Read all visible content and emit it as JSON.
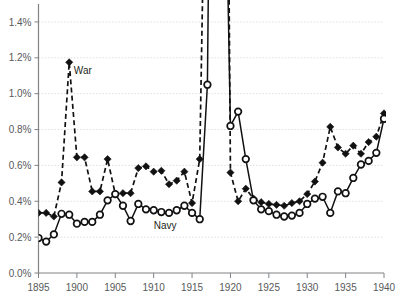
{
  "chart_data": {
    "type": "line",
    "title": "",
    "subtitle": "",
    "xlabel": "",
    "ylabel": "",
    "xlim": [
      1895,
      1940
    ],
    "ylim": [
      0.0,
      1.5
    ],
    "grid": true,
    "legend_position": "inline-annotation",
    "x_tick_labels": [
      "1895",
      "1900",
      "1905",
      "1910",
      "1915",
      "1920",
      "1925",
      "1930",
      "1935",
      "1940"
    ],
    "x_ticks": [
      1895,
      1900,
      1905,
      1910,
      1915,
      1920,
      1925,
      1930,
      1935,
      1940
    ],
    "y_tick_labels": [
      "0.0%",
      "0.2%",
      "0.4%",
      "0.6%",
      "0.8%",
      "1.0%",
      "1.2%",
      "1.4%"
    ],
    "y_ticks": [
      0.0,
      0.2,
      0.4,
      0.6,
      0.8,
      1.0,
      1.2,
      1.4
    ],
    "y_unit": "%",
    "clip_note": "War and Navy series exceed the 1.5% axis top during 1917-1919 and in 1940; those segments run off the top of the plot.",
    "annotations": [
      {
        "text": "War",
        "x": 1899.6,
        "y": 1.11
      },
      {
        "text": "Navy",
        "x": 1910.0,
        "y": 0.245
      }
    ],
    "x": [
      1895,
      1896,
      1897,
      1898,
      1899,
      1900,
      1901,
      1902,
      1903,
      1904,
      1905,
      1906,
      1907,
      1908,
      1909,
      1910,
      1911,
      1912,
      1913,
      1914,
      1915,
      1916,
      1917,
      1918,
      1919,
      1920,
      1921,
      1922,
      1923,
      1924,
      1925,
      1926,
      1927,
      1928,
      1929,
      1930,
      1931,
      1932,
      1933,
      1934,
      1935,
      1936,
      1937,
      1938,
      1939,
      1940
    ],
    "series": [
      {
        "name": "War",
        "marker": "filled-diamond",
        "line_style": "dashed",
        "values": [
          0.335,
          0.335,
          0.315,
          0.505,
          1.175,
          0.645,
          0.645,
          0.455,
          0.455,
          0.635,
          0.44,
          0.445,
          0.445,
          0.585,
          0.595,
          0.565,
          0.57,
          0.495,
          0.515,
          0.565,
          0.39,
          0.635,
          3.1,
          14.5,
          6.2,
          0.56,
          0.4,
          0.47,
          0.415,
          0.395,
          0.385,
          0.38,
          0.375,
          0.39,
          0.4,
          0.44,
          0.51,
          0.615,
          0.815,
          0.7,
          0.665,
          0.71,
          0.665,
          0.73,
          0.76,
          0.89
        ]
      },
      {
        "name": "Navy",
        "marker": "open-circle",
        "line_style": "solid",
        "values": [
          0.195,
          0.175,
          0.215,
          0.33,
          0.325,
          0.275,
          0.285,
          0.285,
          0.325,
          0.405,
          0.44,
          0.375,
          0.29,
          0.385,
          0.355,
          0.35,
          0.34,
          0.335,
          0.35,
          0.375,
          0.335,
          0.3,
          1.05,
          5.4,
          3.1,
          0.82,
          0.9,
          0.635,
          0.405,
          0.355,
          0.345,
          0.325,
          0.315,
          0.32,
          0.335,
          0.385,
          0.415,
          0.425,
          0.335,
          0.455,
          0.445,
          0.53,
          0.605,
          0.625,
          0.67,
          0.86
        ]
      }
    ]
  },
  "colors": {
    "war": "#111111",
    "navy": "#111111",
    "grid": "#d9d9dd",
    "axis": "#808285",
    "tick_text": "#58595b",
    "label_text": "#231f20",
    "background": "#ffffff"
  }
}
